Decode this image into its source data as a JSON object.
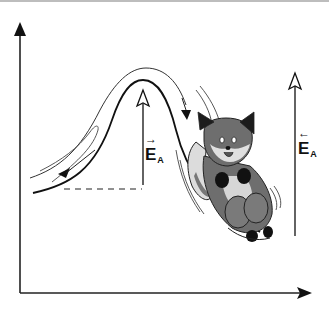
{
  "diagram": {
    "labels": {
      "left_ea": {
        "main": "E",
        "sub": "A",
        "arrow": "→"
      },
      "right_ea": {
        "main": "E",
        "sub": "A",
        "arrow": "←"
      }
    },
    "colors": {
      "line": "#111111",
      "fox_fur": "#6b6b6b",
      "fox_light": "#d9d9d9",
      "fox_dark": "#1a1a1a",
      "background": "#ffffff"
    },
    "elements": [
      "y-axis-arrow",
      "x-axis-arrow",
      "energy-curve",
      "motion-lines",
      "dashed-baseline",
      "activation-energy-arrow-left",
      "activation-energy-arrow-right",
      "fox-cartoon"
    ]
  }
}
